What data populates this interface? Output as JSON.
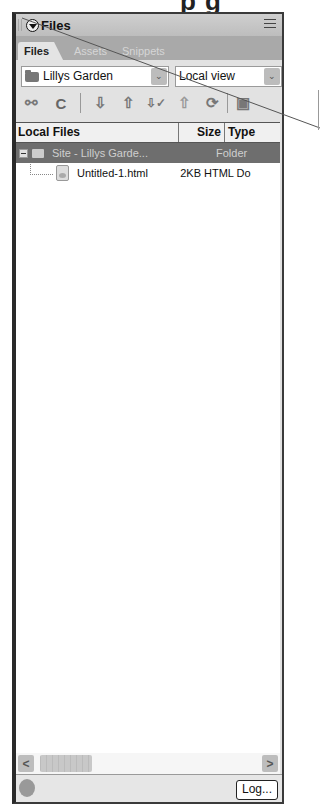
{
  "heading_fragment": "p g",
  "panel": {
    "title": "Files",
    "tabs": [
      {
        "label": "Files",
        "active": true
      },
      {
        "label": "Assets",
        "active": false
      },
      {
        "label": "Snippets",
        "active": false
      }
    ],
    "site_select": {
      "value": "Lillys Garden"
    },
    "view_select": {
      "value": "Local view"
    },
    "toolbar": [
      {
        "name": "connect",
        "glyph": "⚯"
      },
      {
        "name": "refresh",
        "glyph": "C"
      },
      {
        "name": "get",
        "glyph": "⇩"
      },
      {
        "name": "put",
        "glyph": "⇧"
      },
      {
        "name": "check-out",
        "glyph": "⇩✓"
      },
      {
        "name": "check-in",
        "glyph": "⇧"
      },
      {
        "name": "synchronize",
        "glyph": "⟳"
      },
      {
        "name": "expand",
        "glyph": "▣"
      }
    ],
    "list": {
      "columns": [
        "Local Files",
        "Size",
        "Type"
      ],
      "rows": [
        {
          "name": "Site - Lillys Garde...",
          "size": "",
          "type": "Folder",
          "selected": true
        },
        {
          "name": "Untitled-1.html",
          "size": "2KB",
          "type": "HTML Do",
          "selected": false
        }
      ]
    },
    "scrollbar": {
      "left": "<",
      "right": ">"
    },
    "status": {
      "log_label": "Log..."
    }
  }
}
